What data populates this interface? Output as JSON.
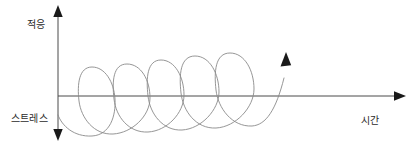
{
  "diagram": {
    "title_visible": false,
    "background_color": "#ffffff",
    "axes": {
      "vertical": {
        "top_label": "적응",
        "bottom_label": "스트레스",
        "x": 58,
        "y_top": 8,
        "y_bottom": 138,
        "color": "#4a4a4a",
        "arrow_top": true,
        "arrow_bottom": true
      },
      "horizontal": {
        "label": "시간",
        "y": 96,
        "x_start": 58,
        "x_end": 404,
        "color": "#4a4a4a",
        "arrow_end": true
      }
    },
    "curve": {
      "name": "ascending-spiral",
      "color": "#8a8a8a",
      "stroke_width": 0.9,
      "loop_count": 5,
      "start_point": {
        "x": 58,
        "y": 115
      },
      "end_point": {
        "x": 285,
        "y": 58
      },
      "end_arrow": true,
      "end_arrow_color": "#1a1a1a",
      "loops": [
        {
          "cx": 96,
          "cy": 101,
          "rx": 19,
          "ry": 35
        },
        {
          "cx": 131,
          "cy": 98,
          "rx": 19,
          "ry": 35
        },
        {
          "cx": 165,
          "cy": 95,
          "rx": 19,
          "ry": 36
        },
        {
          "cx": 199,
          "cy": 93,
          "rx": 20,
          "ry": 37
        },
        {
          "cx": 234,
          "cy": 90,
          "rx": 20,
          "ry": 38
        }
      ]
    },
    "labels": {
      "adaptation": "적응",
      "stress": "스트레스",
      "time": "시간"
    }
  }
}
